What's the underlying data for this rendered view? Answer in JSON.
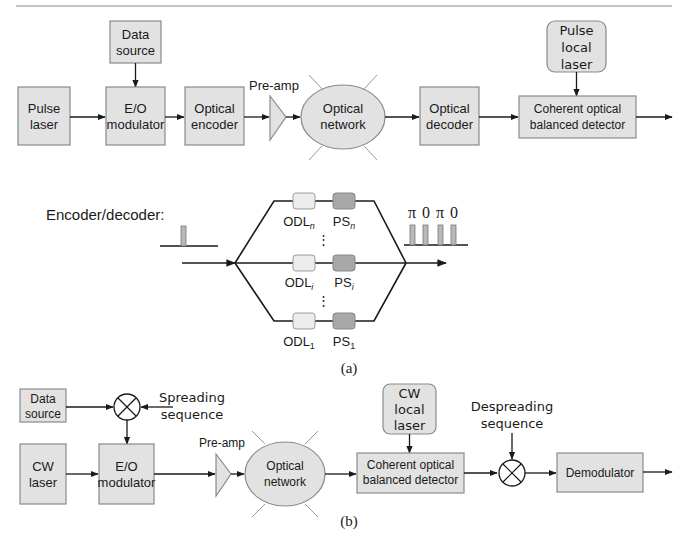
{
  "panel_a": {
    "caption": "(a)",
    "blocks": {
      "pulse_laser": [
        "Pulse",
        "laser"
      ],
      "data_source": [
        "Data",
        "source"
      ],
      "eo_modulator": [
        "E/O",
        "modulator"
      ],
      "optical_encoder": [
        "Optical",
        "encoder"
      ],
      "pre_amp": "Pre-amp",
      "optical_network": [
        "Optical",
        "network"
      ],
      "optical_decoder": [
        "Optical",
        "decoder"
      ],
      "pulse_local_laser": [
        "Pulse",
        "local",
        "laser"
      ],
      "coherent_detector": [
        "Coherent optical",
        "balanced detector"
      ]
    },
    "encoder_decoder": {
      "label": "Encoder/decoder:",
      "branches": [
        {
          "odl": "ODL",
          "odl_sub": "n",
          "ps": "PS",
          "ps_sub": "n"
        },
        {
          "odl": "ODL",
          "odl_sub": "i",
          "ps": "PS",
          "ps_sub": "i"
        },
        {
          "odl": "ODL",
          "odl_sub": "1",
          "ps": "PS",
          "ps_sub": "1"
        }
      ],
      "ellipsis": "⋮",
      "phase_code": [
        "π",
        "0",
        "π",
        "0"
      ]
    }
  },
  "panel_b": {
    "caption": "(b)",
    "blocks": {
      "data_source": [
        "Data",
        "source"
      ],
      "spreading_sequence": [
        "Spreading",
        "sequence"
      ],
      "cw_laser": [
        "CW",
        "laser"
      ],
      "eo_modulator": [
        "E/O",
        "modulator"
      ],
      "pre_amp": "Pre-amp",
      "optical_network": [
        "Optical",
        "network"
      ],
      "cw_local_laser": [
        "CW",
        "local",
        "laser"
      ],
      "coherent_detector": [
        "Coherent optical",
        "balanced detector"
      ],
      "despreading_sequence": [
        "Despreading",
        "sequence"
      ],
      "demodulator": "Demodulator"
    }
  }
}
